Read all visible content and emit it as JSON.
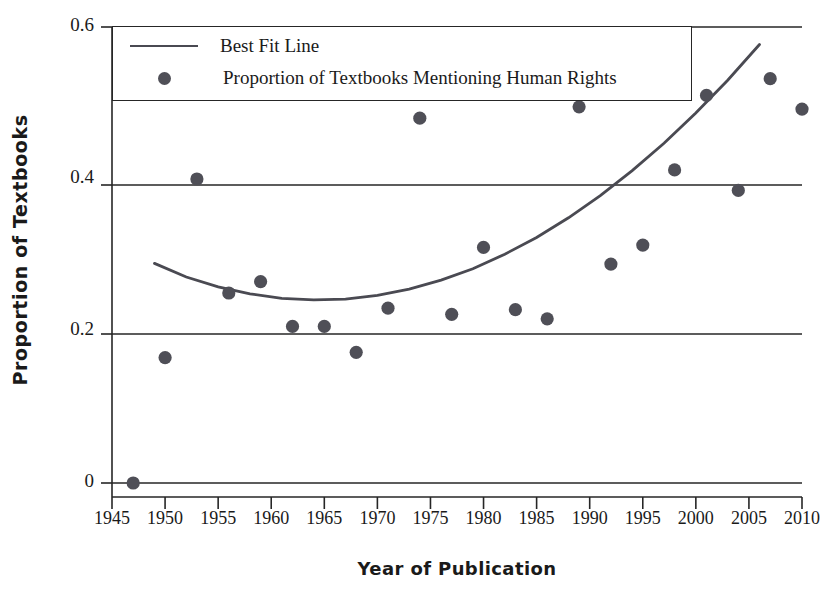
{
  "chart_data": {
    "type": "scatter",
    "title": "",
    "xlabel": "Year of Publication",
    "ylabel": "Proportion of Textbooks",
    "xlim": [
      1945,
      2010
    ],
    "ylim": [
      0,
      0.6
    ],
    "xticks": [
      1945,
      1950,
      1955,
      1960,
      1965,
      1970,
      1975,
      1980,
      1985,
      1990,
      1995,
      2000,
      2005,
      2010
    ],
    "xtick_labels": [
      "1945",
      "1950",
      "1955",
      "1960",
      "1965",
      "1970",
      "1975",
      "1980",
      "1985",
      "1990",
      "1995",
      "2000",
      "2005",
      "2010"
    ],
    "yticks": [
      0,
      0.2,
      0.4,
      0.6
    ],
    "ytick_labels": [
      "0",
      "0.2",
      "0.4",
      "0.6"
    ],
    "grid": "horizontal",
    "legend_position": "top-left",
    "series": [
      {
        "name": "Proportion of Textbooks Mentioning Human Rights",
        "type": "scatter",
        "marker": "circle",
        "color": "#4f4f57",
        "x": [
          1947,
          1950,
          1953,
          1956,
          1959,
          1962,
          1965,
          1968,
          1971,
          1974,
          1977,
          1980,
          1983,
          1986,
          1989,
          1992,
          1995,
          1998,
          2001,
          2004,
          2007,
          2010
        ],
        "y": [
          0.0,
          0.165,
          0.4,
          0.25,
          0.265,
          0.206,
          0.206,
          0.172,
          0.23,
          0.48,
          0.222,
          0.31,
          0.228,
          0.216,
          0.495,
          0.288,
          0.313,
          0.412,
          0.51,
          0.385,
          0.532,
          0.492
        ]
      },
      {
        "name": "Best Fit Line",
        "type": "line",
        "color": "#4a4a52",
        "fit": "quadratic",
        "x": [
          1949,
          1952,
          1955,
          1958,
          1961,
          1964,
          1967,
          1970,
          1973,
          1976,
          1979,
          1982,
          1985,
          1988,
          1991,
          1994,
          1997,
          2000,
          2003,
          2006,
          2009,
          2010
        ],
        "y": [
          0.289,
          0.271,
          0.258,
          0.249,
          0.243,
          0.241,
          0.242,
          0.247,
          0.255,
          0.267,
          0.282,
          0.301,
          0.323,
          0.349,
          0.378,
          0.411,
          0.447,
          0.487,
          0.53,
          0.577,
          0.627,
          0.645
        ]
      }
    ]
  },
  "legend": {
    "entries": [
      {
        "label": "Best Fit Line",
        "marker": "line"
      },
      {
        "label": "Proportion of Textbooks Mentioning Human Rights",
        "marker": "circle"
      }
    ]
  },
  "axes": {
    "ylabel": "Proportion of Textbooks",
    "xlabel": "Year of Publication"
  },
  "colors": {
    "marker": "#4f4f57",
    "line": "#4a4a52",
    "axis": "#262626",
    "text": "#1a1a1a"
  }
}
